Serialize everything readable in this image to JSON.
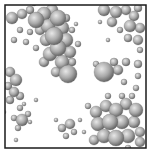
{
  "figure": {
    "kind": "sphere-particle-rendering",
    "frame": {
      "x": 5,
      "y": 5,
      "width": 141,
      "height": 143,
      "stroke": "#1a1a1a"
    },
    "background": "#ffffff",
    "sphere_colors": {
      "highlight": "#e8e8e8",
      "mid": "#a8a8a8",
      "shadow": "#5a5a5a"
    },
    "spheres": [
      [
        12,
        18,
        6
      ],
      [
        22,
        14,
        5
      ],
      [
        30,
        10,
        4
      ],
      [
        36,
        20,
        8
      ],
      [
        44,
        14,
        7
      ],
      [
        52,
        10,
        6
      ],
      [
        58,
        18,
        8
      ],
      [
        48,
        26,
        7
      ],
      [
        40,
        30,
        5
      ],
      [
        62,
        28,
        7
      ],
      [
        54,
        36,
        9
      ],
      [
        66,
        40,
        7
      ],
      [
        46,
        40,
        6
      ],
      [
        58,
        48,
        8
      ],
      [
        70,
        52,
        6
      ],
      [
        50,
        54,
        7
      ],
      [
        62,
        62,
        7
      ],
      [
        44,
        62,
        5
      ],
      [
        72,
        62,
        4
      ],
      [
        68,
        74,
        9
      ],
      [
        56,
        72,
        5
      ],
      [
        42,
        28,
        4
      ],
      [
        30,
        32,
        3
      ],
      [
        20,
        30,
        3
      ],
      [
        14,
        40,
        3
      ],
      [
        26,
        42,
        3
      ],
      [
        36,
        48,
        3
      ],
      [
        66,
        18,
        4
      ],
      [
        72,
        30,
        3
      ],
      [
        78,
        44,
        3
      ],
      [
        76,
        24,
        2
      ],
      [
        34,
        4,
        2
      ],
      [
        104,
        10,
        6
      ],
      [
        116,
        12,
        6
      ],
      [
        126,
        10,
        5
      ],
      [
        134,
        16,
        5
      ],
      [
        138,
        8,
        4
      ],
      [
        112,
        22,
        5
      ],
      [
        130,
        26,
        6
      ],
      [
        140,
        28,
        5
      ],
      [
        138,
        40,
        5
      ],
      [
        128,
        38,
        4
      ],
      [
        120,
        30,
        3
      ],
      [
        100,
        22,
        2
      ],
      [
        140,
        50,
        3
      ],
      [
        108,
        40,
        2
      ],
      [
        104,
        72,
        10
      ],
      [
        118,
        70,
        5
      ],
      [
        126,
        62,
        4
      ],
      [
        114,
        62,
        4
      ],
      [
        96,
        64,
        3
      ],
      [
        124,
        82,
        3
      ],
      [
        138,
        64,
        4
      ],
      [
        138,
        76,
        3
      ],
      [
        136,
        88,
        3
      ],
      [
        10,
        72,
        5
      ],
      [
        16,
        80,
        6
      ],
      [
        8,
        86,
        4
      ],
      [
        14,
        92,
        5
      ],
      [
        20,
        96,
        4
      ],
      [
        10,
        100,
        4
      ],
      [
        20,
        108,
        3
      ],
      [
        22,
        120,
        6
      ],
      [
        14,
        118,
        3
      ],
      [
        28,
        114,
        3
      ],
      [
        18,
        128,
        3
      ],
      [
        30,
        122,
        2
      ],
      [
        24,
        104,
        2
      ],
      [
        36,
        100,
        2
      ],
      [
        4,
        112,
        2
      ],
      [
        70,
        124,
        5
      ],
      [
        62,
        128,
        4
      ],
      [
        74,
        132,
        3
      ],
      [
        66,
        136,
        3
      ],
      [
        80,
        120,
        2
      ],
      [
        56,
        120,
        2
      ],
      [
        16,
        140,
        2
      ],
      [
        96,
        112,
        6
      ],
      [
        106,
        106,
        6
      ],
      [
        116,
        110,
        7
      ],
      [
        126,
        104,
        6
      ],
      [
        136,
        110,
        7
      ],
      [
        98,
        124,
        7
      ],
      [
        110,
        122,
        8
      ],
      [
        122,
        122,
        7
      ],
      [
        134,
        122,
        6
      ],
      [
        104,
        136,
        7
      ],
      [
        116,
        138,
        8
      ],
      [
        128,
        136,
        7
      ],
      [
        140,
        132,
        5
      ],
      [
        94,
        140,
        5
      ],
      [
        140,
        142,
        5
      ],
      [
        108,
        96,
        3
      ],
      [
        122,
        96,
        3
      ],
      [
        132,
        96,
        3
      ],
      [
        88,
        106,
        3
      ],
      [
        84,
        132,
        2
      ],
      [
        128,
        148,
        3
      ]
    ]
  }
}
